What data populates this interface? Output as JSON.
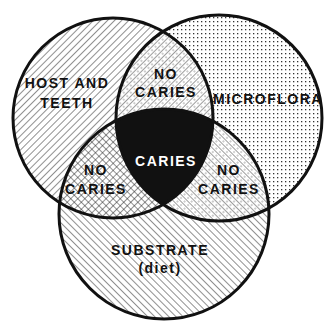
{
  "diagram": {
    "type": "venn-3",
    "colors": {
      "outline": "#111111",
      "background": "#ffffff",
      "center": "#111111"
    },
    "circles": [
      {
        "id": "host",
        "label_lines": [
          "HOST AND",
          "TEETH"
        ],
        "pattern": "diagonal-hatch-forward"
      },
      {
        "id": "microflora",
        "label_lines": [
          "MICROFLORA"
        ],
        "pattern": "dots"
      },
      {
        "id": "substrate",
        "label_lines": [
          "SUBSTRATE",
          "(diet)"
        ],
        "pattern": "diagonal-hatch-back"
      }
    ],
    "intersections": {
      "host_microflora": {
        "label_lines": [
          "NO",
          "CARIES"
        ]
      },
      "host_substrate": {
        "label_lines": [
          "NO",
          "CARIES"
        ]
      },
      "microflora_substrate": {
        "label_lines": [
          "NO",
          "CARIES"
        ]
      },
      "all_three": {
        "label_lines": [
          "CARIES"
        ]
      }
    }
  }
}
